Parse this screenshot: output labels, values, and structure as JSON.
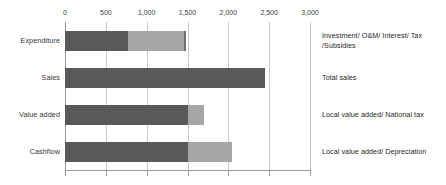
{
  "chart_data": {
    "type": "bar",
    "orientation": "horizontal",
    "stacked": true,
    "title": "",
    "subtitle": "",
    "xlabel": "",
    "ylabel": "",
    "xlim": [
      0,
      3000
    ],
    "grid": true,
    "legend_position": "none",
    "xaxis_position": "top",
    "tick_labels": [
      "0",
      "500",
      "1,000",
      "1,500",
      "2,000",
      "2,500",
      "3,000"
    ],
    "tick_values": [
      0,
      500,
      1000,
      1500,
      2000,
      2500,
      3000
    ],
    "categories": [
      "Expenditure",
      "Sales",
      "Value added",
      "Cashflow"
    ],
    "series": [
      {
        "name": "segment-1",
        "color": "#595959",
        "values": [
          770,
          2450,
          1500,
          1500
        ]
      },
      {
        "name": "segment-2",
        "color": "#a6a6a6",
        "values": [
          690,
          0,
          200,
          550
        ]
      },
      {
        "name": "segment-3",
        "color": "#6e6e6e",
        "values": [
          20,
          0,
          0,
          0
        ]
      }
    ],
    "totals": [
      1480,
      2450,
      1700,
      2050
    ],
    "annotations": [
      "Investment/ O&M/ Interest/ Tax /Subsidies",
      "Total sales",
      "Local value added/ National tax",
      "Local value added/ Depreciation"
    ]
  },
  "colors": {
    "segment_dark": "#595959",
    "segment_light": "#a6a6a6",
    "segment_mid": "#6e6e6e",
    "gridline": "#c9c9c9",
    "axis": "#9a9a9a",
    "text": "#262626",
    "background": "#ffffff"
  }
}
